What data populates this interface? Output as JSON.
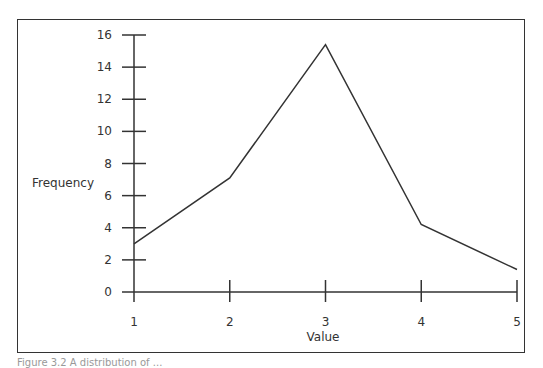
{
  "chart_data": {
    "type": "line",
    "title": "",
    "xlabel": "Value",
    "ylabel": "Frequency",
    "x": [
      1,
      2,
      3,
      4,
      5
    ],
    "categories": [
      "1",
      "2",
      "3",
      "4",
      "5"
    ],
    "values": [
      3,
      7.1,
      15.4,
      4.2,
      1.4
    ],
    "series": [
      {
        "name": "Frequency",
        "values": [
          3,
          7.1,
          15.4,
          4.2,
          1.4
        ]
      }
    ],
    "yticks": [
      0,
      2,
      4,
      6,
      8,
      10,
      12,
      14,
      16
    ],
    "xticks": [
      1,
      2,
      3,
      4,
      5
    ],
    "ylim": [
      0,
      16
    ],
    "xlim": [
      1,
      5
    ],
    "grid": false,
    "legend": null,
    "line_color": "#333333"
  },
  "caption": "Figure 3.2  A distribution of ..."
}
